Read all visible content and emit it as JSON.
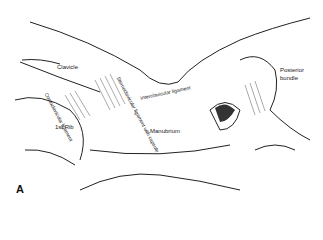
{
  "figure": {
    "panel_label": "A",
    "labels": {
      "clavicle": "Clavicle",
      "costoclavicular": "Costoclavicular ligament",
      "sternoclavicular": "Sternoclavicular ligament with capsule",
      "interclavicular": "Interclavicular ligament",
      "first_rib": "1st Rib",
      "manubrium": "Manubrium",
      "posterior_bundle_1": "Posterior",
      "posterior_bundle_2": "bundle"
    }
  }
}
